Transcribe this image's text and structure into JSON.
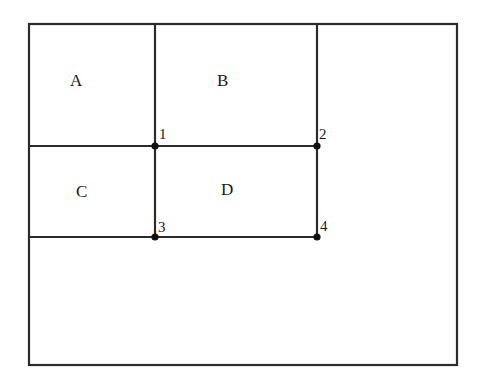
{
  "diagram": {
    "regions": [
      {
        "id": "A",
        "label": "A"
      },
      {
        "id": "B",
        "label": "B"
      },
      {
        "id": "C",
        "label": "C"
      },
      {
        "id": "D",
        "label": "D"
      }
    ],
    "points": [
      {
        "id": "1",
        "label": "1"
      },
      {
        "id": "2",
        "label": "2"
      },
      {
        "id": "3",
        "label": "3"
      },
      {
        "id": "4",
        "label": "4"
      }
    ],
    "colors": {
      "line": "#2b2b2b",
      "text": "#1a1a1a",
      "background": "#ffffff"
    }
  }
}
